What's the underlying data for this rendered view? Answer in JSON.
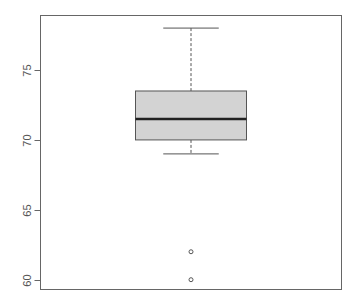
{
  "chart_data": {
    "type": "boxplot",
    "title": "",
    "xlabel": "",
    "ylabel": "",
    "ylim": [
      59.3,
      78.9
    ],
    "y_ticks": [
      60,
      65,
      70,
      75
    ],
    "y_tick_labels": [
      "60",
      "65",
      "70",
      "75"
    ],
    "grid": false,
    "legend": null,
    "series": [
      {
        "name": "",
        "whisker_low": 69,
        "q1": 70,
        "median": 71.5,
        "q3": 73.5,
        "whisker_high": 78,
        "outliers": [
          62,
          60
        ]
      }
    ],
    "colors": {
      "box_fill": "#d3d3d3",
      "box_border": "#555555",
      "median_line": "#222222",
      "whisker": "#555555",
      "axis": "#666666",
      "outlier": "#555555"
    }
  }
}
